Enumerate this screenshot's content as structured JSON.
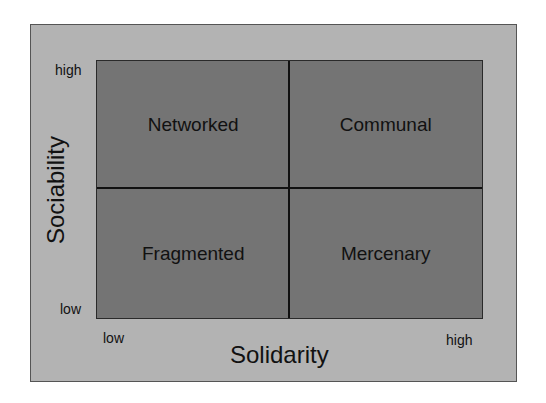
{
  "diagram": {
    "type": "2x2 matrix",
    "colors": {
      "panel_bg": "#b3b3b3",
      "grid_bg": "#747474",
      "lines": "#111111",
      "text": "#111111"
    },
    "x_axis": {
      "title": "Solidarity",
      "low": "low",
      "high": "high"
    },
    "y_axis": {
      "title": "Sociability",
      "low": "low",
      "high": "high"
    },
    "quadrants": {
      "top_left": "Networked",
      "top_right": "Communal",
      "bottom_left": "Fragmented",
      "bottom_right": "Mercenary"
    }
  }
}
